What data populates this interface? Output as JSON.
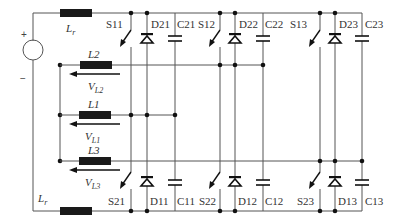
{
  "diagram": {
    "type": "circuit-schematic",
    "source": {
      "plus_label": "+",
      "minus_label": "−"
    },
    "inductors": {
      "lr_top": {
        "name": "L",
        "sub": "r"
      },
      "lr_bottom": {
        "name": "L",
        "sub": "r"
      },
      "l2": {
        "label": "L2",
        "voltage_name": "V",
        "voltage_sub": "L2"
      },
      "l1": {
        "label": "L1",
        "voltage_name": "V",
        "voltage_sub": "L1"
      },
      "l3": {
        "label": "L3",
        "voltage_name": "V",
        "voltage_sub": "L3"
      }
    },
    "top_row": {
      "switches": [
        "S11",
        "S12",
        "S13"
      ],
      "diodes": [
        "D21",
        "D22",
        "D23"
      ],
      "capacitors": [
        "C21",
        "C22",
        "C23"
      ]
    },
    "bottom_row": {
      "switches": [
        "S21",
        "S22",
        "S23"
      ],
      "diodes": [
        "D11",
        "D12",
        "D13"
      ],
      "capacitors": [
        "C11",
        "C12",
        "C13"
      ]
    },
    "connections": [
      {
        "inductor": "L2",
        "phase_leg": 2
      },
      {
        "inductor": "L1",
        "phase_leg": 1
      },
      {
        "inductor": "L3",
        "phase_leg": 3
      }
    ]
  }
}
